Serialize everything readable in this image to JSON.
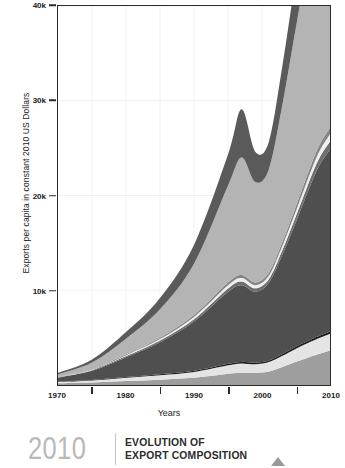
{
  "caption": {
    "year": "2010",
    "line1": "EVOLUTION OF",
    "line2": "EXPORT COMPOSITION"
  },
  "chart_data": {
    "type": "area",
    "stacked": true,
    "title": "",
    "xlabel": "Years",
    "ylabel": "Exports per capita in constant 2010 US Dollars",
    "xlim": [
      1970,
      2010
    ],
    "ylim": [
      0,
      40000
    ],
    "ytick_labels": [
      "10k",
      "20k",
      "30k",
      "40k"
    ],
    "ytick_values": [
      10000,
      20000,
      30000,
      40000
    ],
    "xtick_labels": [
      "1970",
      "1980",
      "1990",
      "2000",
      "2010"
    ],
    "xtick_values": [
      1970,
      1980,
      1990,
      2000,
      2010
    ],
    "minor_xtick_values": [
      1975,
      1985,
      1995,
      2005
    ],
    "grid": true,
    "legend": "none",
    "x": [
      1970,
      1975,
      1980,
      1985,
      1990,
      1995,
      1997,
      1999,
      2001,
      2003,
      2005,
      2008,
      2010
    ],
    "series": [
      {
        "name": "layer-1-bottom",
        "color": "#9e9e9e",
        "values": [
          180,
          260,
          420,
          560,
          760,
          1180,
          1300,
          1260,
          1420,
          1900,
          2450,
          3200,
          3650
        ]
      },
      {
        "name": "layer-2",
        "color": "#e4e4e4",
        "values": [
          140,
          210,
          340,
          470,
          620,
          900,
          980,
          930,
          1000,
          1180,
          1380,
          1620,
          1750
        ]
      },
      {
        "name": "layer-3-thin-dark",
        "color": "#1c1c1c",
        "values": [
          40,
          55,
          80,
          95,
          115,
          150,
          160,
          150,
          160,
          185,
          210,
          240,
          255
        ]
      },
      {
        "name": "layer-4-main-dark",
        "color": "#4f4f4f",
        "values": [
          420,
          980,
          2100,
          3400,
          5200,
          7600,
          8100,
          7500,
          8200,
          10500,
          13200,
          17500,
          19200
        ]
      },
      {
        "name": "layer-5-thin-mid",
        "color": "#6e6e6e",
        "values": [
          30,
          60,
          110,
          170,
          250,
          360,
          390,
          360,
          390,
          480,
          600,
          760,
          840
        ]
      },
      {
        "name": "layer-6-thin-white",
        "color": "#efefef",
        "values": [
          28,
          55,
          100,
          155,
          230,
          330,
          355,
          330,
          355,
          440,
          545,
          690,
          760
        ]
      },
      {
        "name": "layer-7-thin-mid2",
        "color": "#858585",
        "values": [
          26,
          50,
          92,
          142,
          210,
          300,
          325,
          300,
          325,
          400,
          500,
          630,
          695
        ]
      },
      {
        "name": "layer-8-main-light",
        "color": "#b4b4b4",
        "values": [
          260,
          700,
          1650,
          3000,
          5400,
          10200,
          12400,
          10600,
          10900,
          14500,
          18900,
          25200,
          26800
        ]
      },
      {
        "name": "layer-9-top-dark",
        "color": "#5a5a5a",
        "values": [
          160,
          330,
          700,
          1200,
          2000,
          3300,
          5100,
          3200,
          2900,
          4100,
          5400,
          6900,
          7450
        ]
      }
    ]
  }
}
